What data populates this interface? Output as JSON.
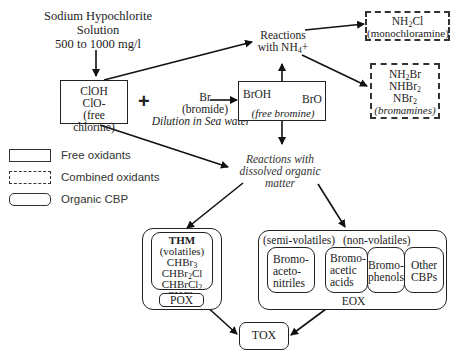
{
  "source": {
    "line1": "Sodium Hypochlorite",
    "line2": "Solution",
    "line3": "500 to 1000 mg/l"
  },
  "free_chlorine_box": {
    "line1": "ClOH",
    "line2": "ClO-",
    "line3": "(free chlorine)"
  },
  "plus_sign": "+",
  "bromide": {
    "line1": "Br",
    "line2": "(bromide)",
    "line3": "Dilution in Sea water"
  },
  "free_bromine_box": {
    "left": "BrOH",
    "right": "BrO",
    "label": "(free bromine)"
  },
  "ammonium_reaction": {
    "line1": "Reactions",
    "line2": "with NH",
    "sub": "4",
    "suffix": "+"
  },
  "monochloramine_box": {
    "formula_a": "NH",
    "formula_sub": "2",
    "formula_b": "Cl",
    "label": "(monochloramine)"
  },
  "bromamines_box": {
    "f1a": "NH",
    "f1sub": "2",
    "f1b": "Br",
    "f2a": "NHBr",
    "f2sub": "2",
    "f3a": "NBr",
    "f3sub": "2",
    "label": "(bromamines)"
  },
  "organic_reaction": {
    "line1": "Reactions with",
    "line2": "dissolved organic",
    "line3": "matter"
  },
  "legend": {
    "items": [
      {
        "label": "Free oxidants",
        "style": "solid"
      },
      {
        "label": "Combined oxidants",
        "style": "dashed"
      },
      {
        "label": "Organic CBP",
        "style": "rounded"
      }
    ]
  },
  "thm_group": {
    "title": "THM",
    "subtitle": "(volatiles)",
    "c1a": "CHBr",
    "c1sub": "3",
    "c2a": "CHBr",
    "c2sub": "2",
    "c2b": "Cl",
    "c3a": "CHBrCl",
    "c3sub": "2",
    "c4a": "CHCl",
    "c4sub": "3",
    "footer": "POX"
  },
  "eox_group": {
    "semi_label": "(semi-volatiles)",
    "non_label": "(non-volatiles)",
    "items": [
      {
        "l1": "Bromo-",
        "l2": "aceto-",
        "l3": "nitriles"
      },
      {
        "l1": "Bromo-",
        "l2": "acetic",
        "l3": "acids"
      },
      {
        "l1": "Bromo-",
        "l2": "phenols",
        "l3": ""
      },
      {
        "l1": "Other",
        "l2": "CBPs",
        "l3": ""
      }
    ],
    "footer": "EOX"
  },
  "tox_box": {
    "label": "TOX"
  }
}
